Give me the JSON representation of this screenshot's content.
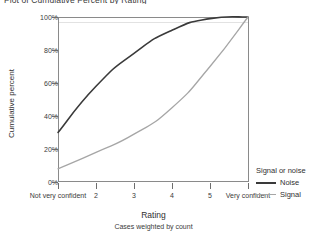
{
  "title": "Plot of Cumulative Percent by Rating",
  "axes": {
    "y_title": "Cumulative percent",
    "x_title": "Rating",
    "x_note": "Cases weighted by count"
  },
  "legend": {
    "title": "Signal or noise",
    "entries": [
      {
        "label": "Noise",
        "color": "#3a3a3a"
      },
      {
        "label": "Signal",
        "color": "#a6a6a6"
      }
    ]
  },
  "chart_data": {
    "type": "line",
    "title": "Plot of Cumulative Percent by Rating",
    "xlabel": "Rating",
    "ylabel": "Cumulative percent",
    "note": "Cases weighted by count",
    "categories": [
      "Not very confident",
      "2",
      "3",
      "4",
      "5",
      "Very confident"
    ],
    "ytick_labels": [
      "0%",
      "20%",
      "40%",
      "60%",
      "80%",
      "100%"
    ],
    "ytick_values": [
      0,
      20,
      40,
      60,
      80,
      100
    ],
    "ylim": [
      0,
      100
    ],
    "grid": false,
    "legend_position": "right",
    "series": [
      {
        "name": "Noise",
        "color": "#3a3a3a",
        "values": [
          30,
          58,
          78,
          92,
          99,
          100
        ]
      },
      {
        "name": "Signal",
        "color": "#a6a6a6",
        "values": [
          8,
          18,
          29,
          45,
          70,
          100
        ]
      }
    ]
  }
}
